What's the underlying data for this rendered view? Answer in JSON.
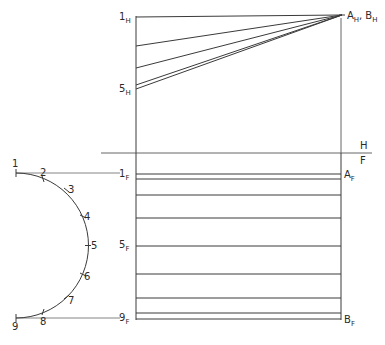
{
  "diagram": {
    "type": "orthographic-projection",
    "fold_line": {
      "upper_label": "H",
      "lower_label": "F"
    },
    "top_view": {
      "labels": {
        "start_1": {
          "main": "1",
          "sub": "H"
        },
        "start_5": {
          "main": "5",
          "sub": "H"
        },
        "apex": {
          "text_a": "A",
          "sub_a": "H",
          "sep": ",",
          "text_b": "B",
          "sub_b": "H"
        }
      }
    },
    "front_view": {
      "labels": {
        "row_1": {
          "main": "1",
          "sub": "F"
        },
        "row_5": {
          "main": "5",
          "sub": "F"
        },
        "row_9": {
          "main": "9",
          "sub": "F"
        },
        "corner_a": {
          "main": "A",
          "sub": "F"
        },
        "corner_b": {
          "main": "B",
          "sub": "F"
        }
      }
    },
    "division_arc": {
      "points": [
        "1",
        "2",
        "3",
        "4",
        "5",
        "6",
        "7",
        "8",
        "9"
      ]
    }
  }
}
